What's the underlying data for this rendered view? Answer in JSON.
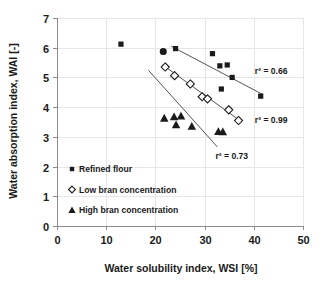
{
  "chart_data": {
    "type": "scatter",
    "title": "",
    "xlabel": "Water solubility index, WSI [%]",
    "ylabel": "Water absorption index, WAI [-]",
    "xlim": [
      0,
      50
    ],
    "ylim": [
      0,
      7
    ],
    "xticks": [
      0,
      10,
      20,
      30,
      40,
      50
    ],
    "yticks": [
      0,
      1,
      2,
      3,
      4,
      5,
      6,
      7
    ],
    "xtick_labels": [
      "0",
      "10",
      "20",
      "30",
      "40",
      "50"
    ],
    "ytick_labels": [
      "0",
      "1",
      "2",
      "3",
      "4",
      "5",
      "6",
      "7"
    ],
    "grid": true,
    "legend_position": "lower-left-inside",
    "series": [
      {
        "name": "Refined flour",
        "marker": "filled-square",
        "color": "#1a1a1a",
        "points": [
          {
            "x": 13.0,
            "y": 6.12
          },
          {
            "x": 21.6,
            "y": 5.87
          },
          {
            "x": 24.1,
            "y": 5.97
          },
          {
            "x": 31.6,
            "y": 5.8
          },
          {
            "x": 33.1,
            "y": 5.39
          },
          {
            "x": 34.6,
            "y": 5.42
          },
          {
            "x": 33.4,
            "y": 4.61
          },
          {
            "x": 35.6,
            "y": 5.0
          },
          {
            "x": 41.4,
            "y": 4.37
          }
        ],
        "trendline": {
          "x1": 23.2,
          "y1": 6.05,
          "x2": 41.9,
          "y2": 4.42
        },
        "r2_label": "r² = 0.66"
      },
      {
        "name": "Low bran concentration",
        "marker": "open-diamond",
        "color": "#ffffff",
        "points": [
          {
            "x": 22.0,
            "y": 5.35
          },
          {
            "x": 23.9,
            "y": 5.06
          },
          {
            "x": 27.1,
            "y": 4.78
          },
          {
            "x": 29.5,
            "y": 4.35
          },
          {
            "x": 30.6,
            "y": 4.28
          },
          {
            "x": 34.9,
            "y": 3.91
          },
          {
            "x": 36.9,
            "y": 3.55
          }
        ],
        "trendline": {
          "x1": 21.5,
          "y1": 5.42,
          "x2": 37.4,
          "y2": 3.52
        },
        "r2_label": "r² = 0.99"
      },
      {
        "name": "High bran concentration",
        "marker": "filled-triangle",
        "color": "#1a1a1a",
        "points": [
          {
            "x": 21.8,
            "y": 3.63
          },
          {
            "x": 23.8,
            "y": 3.68
          },
          {
            "x": 24.2,
            "y": 3.41
          },
          {
            "x": 25.2,
            "y": 3.7
          },
          {
            "x": 27.4,
            "y": 3.36
          },
          {
            "x": 32.8,
            "y": 3.18
          },
          {
            "x": 33.7,
            "y": 3.17
          }
        ],
        "trendline": {
          "x1": 18.6,
          "y1": 5.24,
          "x2": 32.6,
          "y2": 2.66
        },
        "r2_label": "r² = 0.73"
      }
    ],
    "annotations": [
      {
        "text": "r² = 0.66",
        "x": 40.2,
        "y": 5.22
      },
      {
        "text": "r² = 0.99",
        "x": 40.2,
        "y": 3.56
      },
      {
        "text": "r² = 0.73",
        "x": 32.2,
        "y": 2.37
      }
    ],
    "legend": [
      {
        "label": "Refined flour",
        "marker": "filled-square"
      },
      {
        "label": "Low bran concentration",
        "marker": "open-diamond"
      },
      {
        "label": "High bran concentration",
        "marker": "filled-triangle"
      }
    ]
  }
}
